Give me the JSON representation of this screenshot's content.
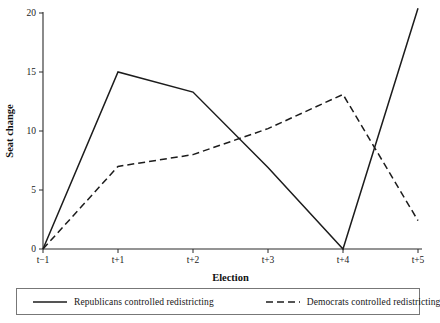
{
  "chart_data": {
    "type": "line",
    "title": "",
    "xlabel": "Election",
    "ylabel": "Seat change",
    "categories": [
      "t−1",
      "t+1",
      "t+2",
      "t+3",
      "t+4",
      "t+5"
    ],
    "x_positions": [
      0,
      1,
      2,
      3,
      4,
      5
    ],
    "xlim": [
      0,
      5
    ],
    "ylim": [
      0,
      20
    ],
    "y_ticks": [
      0,
      5,
      10,
      15,
      20
    ],
    "y_tick_labels": [
      "0",
      "5",
      "10",
      "15",
      "20"
    ],
    "grid": false,
    "legend_position": "below-plot",
    "series": [
      {
        "name": "Republicans controlled redistricting",
        "style": "solid",
        "color": "#1c1c1c",
        "values": [
          0,
          15,
          13.3,
          6.9,
          0,
          20.4
        ]
      },
      {
        "name": "Democrats controlled redistricting",
        "style": "dashed",
        "color": "#1c1c1c",
        "values": [
          0,
          7,
          8,
          10.2,
          13.1,
          2.4
        ]
      }
    ]
  },
  "legend": {
    "entries": [
      {
        "label": "Republicans controlled redistricting",
        "style": "solid"
      },
      {
        "label": "Democrats controlled redistricting",
        "style": "dashed"
      }
    ]
  }
}
